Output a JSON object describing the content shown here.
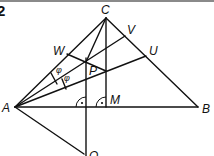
{
  "figure": {
    "number": "2",
    "points": {
      "A": {
        "label": "A",
        "x": 15,
        "y": 107
      },
      "B": {
        "label": "B",
        "x": 198,
        "y": 107
      },
      "C": {
        "label": "C",
        "x": 106,
        "y": 18
      },
      "M": {
        "label": "M",
        "x": 106,
        "y": 107
      },
      "P": {
        "label": "P",
        "x": 86,
        "y": 62
      },
      "W": {
        "label": "W",
        "x": 67,
        "y": 54
      },
      "V": {
        "label": "V",
        "x": 125,
        "y": 36
      },
      "U": {
        "label": "U",
        "x": 146,
        "y": 56
      },
      "Q": {
        "label": "Q",
        "x": 86,
        "y": 156
      }
    },
    "angle_labels": [
      "φ",
      "φ"
    ],
    "right_angle_markers": [
      "at foot of vertical through P",
      "at M"
    ]
  }
}
